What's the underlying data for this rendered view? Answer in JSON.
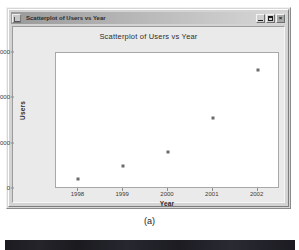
{
  "window": {
    "title": "Scatterplot of Users vs Year",
    "icon": "application-icon",
    "buttons": {
      "minimize": "_",
      "maximize": "□",
      "close": "×"
    }
  },
  "caption": "(a)",
  "colors": {
    "point": "#6b6b6b",
    "plot_background": "#ffffff",
    "panel_background": "#eaeaea",
    "window_chrome": "#d3d3d3",
    "axis": "#a8a8a8",
    "text": "#2e2e2e"
  },
  "chart_data": {
    "type": "scatter",
    "title": "Scatterplot of Users vs Year",
    "xlabel": "Year",
    "ylabel": "Users",
    "x": [
      1998,
      1999,
      2000,
      2001,
      2002
    ],
    "values": [
      2200,
      5100,
      8200,
      15600,
      26200
    ],
    "series": [
      {
        "name": "Users",
        "points": [
          {
            "x": 1998,
            "y": 2200
          },
          {
            "x": 1999,
            "y": 5100
          },
          {
            "x": 2000,
            "y": 8200
          },
          {
            "x": 2001,
            "y": 15600
          },
          {
            "x": 2002,
            "y": 26200
          }
        ]
      }
    ],
    "xlim": [
      1997.5,
      2002.5
    ],
    "ylim": [
      0,
      30000
    ],
    "xticks": [
      1998,
      1999,
      2000,
      2001,
      2002
    ],
    "xticklabels": [
      "1998",
      "1999",
      "2000",
      "2001",
      "2002"
    ],
    "yticks": [
      0,
      10000,
      20000,
      30000
    ],
    "yticklabels": [
      "0",
      "10000",
      "20000",
      "30000"
    ],
    "grid": false,
    "legend": false,
    "marker": "dot"
  }
}
